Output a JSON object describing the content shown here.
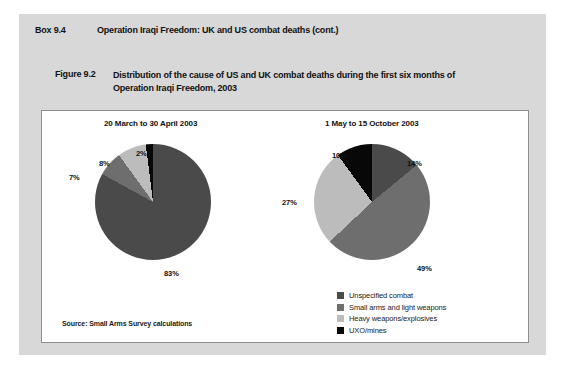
{
  "box": {
    "number": "Box 9.4",
    "title": "Operation Iraqi Freedom: UK and US combat deaths (cont.)"
  },
  "figure": {
    "number": "Figure 9.2",
    "title": "Distribution of the cause of US and UK combat deaths during the first six months of Operation Iraqi Freedom, 2003"
  },
  "source": {
    "text": "Source: Small Arms Survey calculations"
  },
  "colors": {
    "page_background": "#ffffff",
    "box_background": "#d8d8d8",
    "panel_background": "#ffffff",
    "panel_border": "#8e8e8e",
    "unspecified_combat": "#4a4a4a",
    "small_arms": "#6e6e6e",
    "heavy_weapons": "#bcbcbc",
    "uxo_mines": "#080808",
    "text": "#111111"
  },
  "legend": {
    "items": [
      {
        "label": "Unspecified combat",
        "color": "#4a4a4a"
      },
      {
        "label": "Small arms and light weapons",
        "color": "#6e6e6e"
      },
      {
        "label": "Heavy weapons/explosives",
        "color": "#bcbcbc"
      },
      {
        "label": "UXO/mines",
        "color": "#080808"
      }
    ]
  },
  "chart_data": [
    {
      "type": "pie",
      "title": "20 March to 30 April 2003",
      "categories": [
        "Unspecified combat",
        "Small arms and light weapons",
        "Heavy weapons/explosives",
        "UXO/mines"
      ],
      "values": [
        83,
        7,
        8,
        2
      ],
      "labels": [
        "83%",
        "7%",
        "8%",
        "2%"
      ],
      "colors": [
        "#4a4a4a",
        "#6e6e6e",
        "#bcbcbc",
        "#080808"
      ],
      "units": "percent",
      "legend_position": "bottom-right-shared"
    },
    {
      "type": "pie",
      "title": "1 May to 15 October 2003",
      "categories": [
        "Unspecified combat",
        "Small arms and light weapons",
        "Heavy weapons/explosives",
        "UXO/mines"
      ],
      "values": [
        14,
        49,
        27,
        10
      ],
      "labels": [
        "14%",
        "49%",
        "27%",
        "10%"
      ],
      "colors": [
        "#4a4a4a",
        "#6e6e6e",
        "#bcbcbc",
        "#080808"
      ],
      "units": "percent",
      "legend_position": "bottom-right-shared"
    }
  ]
}
